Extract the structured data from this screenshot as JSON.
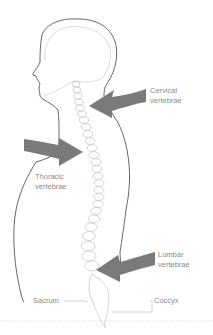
{
  "diagram": {
    "colors": {
      "outline": "#555555",
      "inner_outline": "#cfcfcf",
      "vertebrae": "#c8c8c8",
      "arrow": "#7a7a7a",
      "label_text": "#8a8a8a",
      "leader_line": "#b5b5b5",
      "ground_line": "#bdbdbd"
    },
    "labels": {
      "cervical": {
        "line1": "Cervical",
        "line2": "vertebrae"
      },
      "thoracic": {
        "line1": "Thoracic",
        "line2": "vertebrae"
      },
      "lumbar": {
        "line1": "Lumbar",
        "line2": "vertebrae"
      },
      "sacrum": "Sacrum",
      "coccyx": "Coccyx"
    },
    "arrows": [
      {
        "target": "cervical",
        "direction": "left"
      },
      {
        "target": "thoracic",
        "direction": "right"
      },
      {
        "target": "lumbar",
        "direction": "left"
      }
    ]
  }
}
